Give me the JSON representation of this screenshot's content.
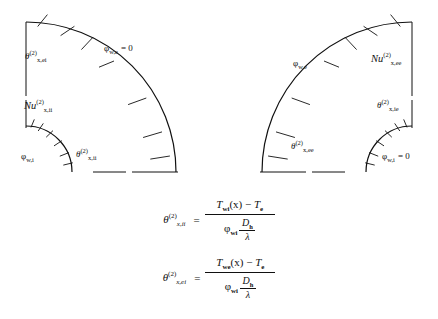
{
  "figure": {
    "type": "technical-diagram"
  },
  "panels": [
    {
      "id": "left-panel",
      "name": "case-ii-ei",
      "labels": {
        "theta_outer": {
          "base": "θ",
          "sup": "(2)",
          "sub": "x,ei"
        },
        "nu": {
          "base": "Nu",
          "sup": "(2)",
          "sub": "x,ii"
        },
        "phi_inner": {
          "base": "φ",
          "sub": "w,i",
          "value": ""
        },
        "phi_outer": {
          "base": "φ",
          "sub": "w,e",
          "value": "= 0"
        },
        "theta_inner": {
          "base": "θ",
          "sup": "(2)",
          "sub": "x,ii"
        }
      }
    },
    {
      "id": "right-panel",
      "name": "case-ee-ie",
      "labels": {
        "nu": {
          "base": "Nu",
          "sup": "(2)",
          "sub": "x,ee"
        },
        "theta_upper": {
          "base": "θ",
          "sup": "(2)",
          "sub": "x,ie"
        },
        "phi_inner": {
          "base": "φ",
          "sub": "w,i",
          "value": "= 0"
        },
        "phi_outer": {
          "base": "φ",
          "sub": "w,e",
          "value": ""
        },
        "theta_outer": {
          "base": "θ",
          "sup": "(2)",
          "sub": "x,ee"
        }
      }
    }
  ],
  "equations": [
    {
      "id": "eq-theta-x-ii",
      "lhs": {
        "base": "θ",
        "sup": "(2)",
        "sub": "x,ii"
      },
      "relation": "=",
      "numerator": {
        "temp": "T",
        "temp_sub": "wi",
        "arg": "(x)",
        "minus": "−",
        "term2": "T",
        "term2_sub": "e"
      },
      "denominator": {
        "phi": "φ",
        "phi_sub": "wi",
        "frac_num": "D",
        "frac_num_sub": "h",
        "frac_den": "λ"
      }
    },
    {
      "id": "eq-theta-x-ei",
      "lhs": {
        "base": "θ",
        "sup": "(2)",
        "sub": "x,ei"
      },
      "relation": "=",
      "numerator": {
        "temp": "T",
        "temp_sub": "we",
        "arg": "(x)",
        "minus": "−",
        "term2": "T",
        "term2_sub": "e"
      },
      "denominator": {
        "phi": "φ",
        "phi_sub": "wi",
        "frac_num": "D",
        "frac_num_sub": "h",
        "frac_den": "λ"
      }
    }
  ],
  "colors": {
    "line": "#111111",
    "background": "#ffffff"
  }
}
